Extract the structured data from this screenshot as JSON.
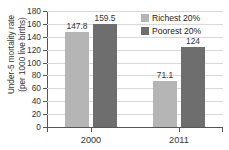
{
  "chart_data": {
    "type": "bar",
    "title": "",
    "subtitle": "",
    "xlabel": "",
    "ylabel": "Under-5 mortality rate (per 1000 live births)",
    "ylabel_lines": [
      "Under-5 mortality rate",
      "(per 1000 live births)"
    ],
    "categories": [
      "2000",
      "2011"
    ],
    "series": [
      {
        "name": "Richest 20%",
        "color": "#b5b5b5",
        "values": [
          147.8,
          71.1
        ],
        "labels": [
          "147.8",
          "71.1"
        ]
      },
      {
        "name": "Poorest 20%",
        "color": "#6e6e6e",
        "values": [
          159.5,
          124
        ],
        "labels": [
          "159.5",
          "124"
        ]
      }
    ],
    "ylim": [
      0,
      180
    ],
    "yticks": [
      0,
      20,
      40,
      60,
      80,
      100,
      120,
      140,
      160,
      180
    ],
    "ytick_labels": [
      "0",
      "20",
      "40",
      "60",
      "80",
      "100",
      "120",
      "140",
      "160",
      "180"
    ],
    "grid": true,
    "grid_color": "#d9d9d9",
    "axis_color": "#555555",
    "legend_position": "top-right",
    "background": "#ffffff"
  }
}
